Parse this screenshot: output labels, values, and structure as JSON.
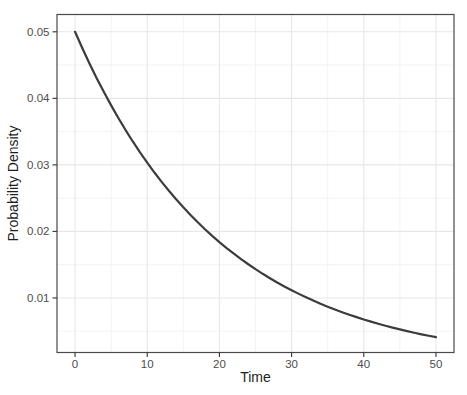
{
  "figure": {
    "background_color": "#ffffff",
    "panel": {
      "background_color": "#ffffff",
      "border_color": "#4a4a4a",
      "grid_major_color": "#e7e7e7",
      "grid_minor_color": "#f2f2f2"
    },
    "axis": {
      "tick_mark_color": "#333333",
      "tick_label_color": "#4d4d4d",
      "title_color": "#1d1d1d"
    }
  },
  "chart_data": {
    "type": "line",
    "title": "",
    "xlabel": "Time",
    "ylabel": "Probability Density",
    "xlim": [
      -2.5,
      52.5
    ],
    "ylim": [
      0.0018,
      0.0526
    ],
    "grid": "major-and-minor",
    "legend": "none",
    "x_ticks": [
      0,
      10,
      20,
      30,
      40,
      50
    ],
    "x_tick_labels": [
      "0",
      "10",
      "20",
      "30",
      "40",
      "50"
    ],
    "x_minor_ticks": [
      5,
      15,
      25,
      35,
      45
    ],
    "y_ticks": [
      0.01,
      0.02,
      0.03,
      0.04,
      0.05
    ],
    "y_tick_labels": [
      "0.01",
      "0.02",
      "0.03",
      "0.04",
      "0.05"
    ],
    "y_minor_ticks": [
      0.005,
      0.015,
      0.025,
      0.035,
      0.045
    ],
    "series": [
      {
        "name": "exponential-pdf-rate-0.05",
        "color": "#3c3c3c",
        "width": 2.2,
        "x": [
          0,
          1,
          2,
          3,
          4,
          5,
          6,
          7,
          8,
          9,
          10,
          11,
          12,
          13,
          14,
          15,
          16,
          17,
          18,
          19,
          20,
          21,
          22,
          23,
          24,
          25,
          26,
          27,
          28,
          29,
          30,
          31,
          32,
          33,
          34,
          35,
          36,
          37,
          38,
          39,
          40,
          41,
          42,
          43,
          44,
          45,
          46,
          47,
          48,
          49,
          50
        ],
        "y": [
          0.05,
          0.047561,
          0.045242,
          0.043035,
          0.040937,
          0.03894,
          0.037041,
          0.035234,
          0.033516,
          0.031881,
          0.030327,
          0.028848,
          0.027441,
          0.026103,
          0.024829,
          0.023618,
          0.022466,
          0.021371,
          0.020328,
          0.019337,
          0.018394,
          0.017497,
          0.016644,
          0.015832,
          0.01506,
          0.014326,
          0.013627,
          0.012962,
          0.01233,
          0.011729,
          0.011157,
          0.010612,
          0.010095,
          0.009602,
          0.009134,
          0.008689,
          0.008265,
          0.007862,
          0.007478,
          0.007114,
          0.006767,
          0.006437,
          0.006123,
          0.005824,
          0.00554,
          0.00527,
          0.005013,
          0.004768,
          0.004536,
          0.004314,
          0.004104
        ]
      }
    ]
  }
}
